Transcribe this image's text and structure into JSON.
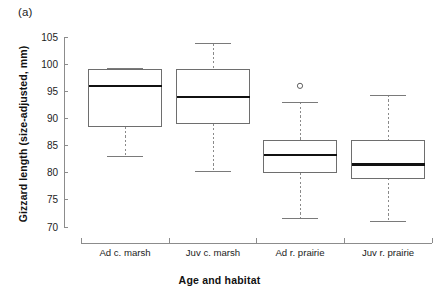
{
  "panel": {
    "label": "(a)"
  },
  "chart_data": {
    "type": "boxplot",
    "title": "",
    "panel_label": "(a)",
    "xlabel": "Age and habitat",
    "ylabel": "Gizzard length (size-adjusted, mm)",
    "categories": [
      "Ad c. marsh",
      "Juv c. marsh",
      "Ad r. prairie",
      "Juv r. prairie"
    ],
    "ylim": [
      70,
      105
    ],
    "yticks": [
      70,
      75,
      80,
      85,
      90,
      95,
      100,
      105
    ],
    "ytick_labels": [
      "70",
      "75",
      "80",
      "85",
      "90",
      "95",
      "100",
      "105"
    ],
    "grid": false,
    "legend": false,
    "boxes": [
      {
        "category": "Ad c. marsh",
        "whisker_low": 83.0,
        "q1": 88.5,
        "median": 96.0,
        "q3": 99.0,
        "whisker_high": 99.2,
        "outliers": []
      },
      {
        "category": "Juv c. marsh",
        "whisker_low": 80.3,
        "q1": 89.0,
        "median": 94.0,
        "q3": 99.0,
        "whisker_high": 103.8,
        "outliers": []
      },
      {
        "category": "Ad r. prairie",
        "whisker_low": 71.5,
        "q1": 80.0,
        "median": 83.3,
        "q3": 86.0,
        "whisker_high": 93.0,
        "outliers": [
          96.0
        ]
      },
      {
        "category": "Juv r. prairie",
        "whisker_low": 71.0,
        "q1": 79.0,
        "median": 81.5,
        "q3": 86.0,
        "whisker_high": 94.3,
        "outliers": []
      }
    ],
    "colors": {
      "box_fill": "#ffffff",
      "box_stroke": "#6e6e6e",
      "median": "#111111",
      "whisker": "#8a8a8a",
      "axis": "#8c8c8c",
      "text": "#1c1c1c",
      "background": "#ffffff"
    }
  }
}
